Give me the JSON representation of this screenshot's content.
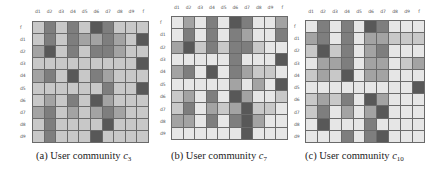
{
  "shade_scale": [
    "#e6e6e6",
    "#c8c8c8",
    "#a3a3a3",
    "#7e7e7e",
    "#585858"
  ],
  "chart_data": [
    {
      "type": "heatmap",
      "title": "(a) User community c3",
      "caption_prefix": "(a)  User community ",
      "caption_var": "c",
      "caption_sub": "3",
      "x_labels": [
        "d1",
        "d2",
        "d3",
        "d4",
        "d5",
        "d6",
        "d7",
        "d8",
        "d9",
        "f"
      ],
      "y_labels": [
        "f",
        "d1",
        "d2",
        "d3",
        "d4",
        "d5",
        "d6",
        "d7",
        "d8",
        "d9"
      ],
      "values": [
        [
          1,
          3,
          1,
          3,
          1,
          4,
          3,
          1,
          1,
          1
        ],
        [
          1,
          3,
          1,
          3,
          2,
          2,
          3,
          2,
          1,
          4
        ],
        [
          2,
          4,
          1,
          3,
          1,
          3,
          3,
          2,
          1,
          1
        ],
        [
          1,
          1,
          1,
          1,
          1,
          1,
          1,
          1,
          1,
          4
        ],
        [
          2,
          3,
          1,
          4,
          1,
          3,
          2,
          1,
          1,
          1
        ],
        [
          1,
          1,
          1,
          1,
          1,
          1,
          3,
          1,
          1,
          4
        ],
        [
          1,
          2,
          1,
          3,
          1,
          4,
          2,
          1,
          1,
          1
        ],
        [
          2,
          3,
          1,
          2,
          1,
          2,
          3,
          2,
          1,
          1
        ],
        [
          1,
          3,
          1,
          1,
          1,
          1,
          4,
          1,
          1,
          1
        ],
        [
          1,
          3,
          1,
          1,
          1,
          4,
          1,
          1,
          1,
          1
        ]
      ],
      "value_range": [
        0,
        4
      ]
    },
    {
      "type": "heatmap",
      "title": "(b) User community c7",
      "caption_prefix": "(b)  User community ",
      "caption_var": "c",
      "caption_sub": "7",
      "x_labels": [
        "d1",
        "d2",
        "d3",
        "d4",
        "d5",
        "d6",
        "d7",
        "d8",
        "d9",
        "f"
      ],
      "y_labels": [
        "f",
        "d1",
        "d2",
        "d3",
        "d4",
        "d5",
        "d6",
        "d7",
        "d8",
        "d9"
      ],
      "values": [
        [
          0,
          2,
          0,
          3,
          0,
          4,
          3,
          0,
          0,
          2
        ],
        [
          0,
          3,
          0,
          3,
          0,
          3,
          2,
          0,
          0,
          3
        ],
        [
          2,
          4,
          1,
          3,
          1,
          3,
          3,
          1,
          0,
          0
        ],
        [
          0,
          0,
          0,
          0,
          0,
          3,
          0,
          0,
          0,
          4
        ],
        [
          2,
          3,
          0,
          4,
          0,
          3,
          2,
          1,
          1,
          0
        ],
        [
          0,
          0,
          0,
          0,
          0,
          2,
          0,
          2,
          0,
          4
        ],
        [
          1,
          2,
          0,
          3,
          0,
          4,
          2,
          0,
          0,
          1
        ],
        [
          1,
          3,
          0,
          2,
          1,
          2,
          4,
          1,
          1,
          0
        ],
        [
          2,
          2,
          0,
          3,
          0,
          3,
          4,
          2,
          0,
          0
        ],
        [
          0,
          0,
          0,
          0,
          0,
          0,
          4,
          0,
          0,
          0
        ]
      ],
      "value_range": [
        0,
        4
      ]
    },
    {
      "type": "heatmap",
      "title": "(c) User community c10",
      "caption_prefix": "(c)  User community ",
      "caption_var": "c",
      "caption_sub": "10",
      "x_labels": [
        "d1",
        "d2",
        "d3",
        "d4",
        "d5",
        "d6",
        "d7",
        "d8",
        "d9",
        "f"
      ],
      "y_labels": [
        "f",
        "d1",
        "d2",
        "d3",
        "d4",
        "d5",
        "d6",
        "d7",
        "d8",
        "d9"
      ],
      "values": [
        [
          0,
          3,
          0,
          3,
          0,
          4,
          3,
          0,
          0,
          0
        ],
        [
          2,
          3,
          0,
          3,
          0,
          2,
          2,
          1,
          1,
          1
        ],
        [
          1,
          4,
          1,
          3,
          0,
          2,
          3,
          0,
          0,
          0
        ],
        [
          0,
          2,
          2,
          3,
          0,
          2,
          2,
          0,
          1,
          2
        ],
        [
          1,
          2,
          1,
          4,
          0,
          2,
          2,
          0,
          0,
          0
        ],
        [
          0,
          0,
          0,
          0,
          0,
          0,
          0,
          0,
          0,
          4
        ],
        [
          1,
          2,
          1,
          3,
          0,
          4,
          2,
          0,
          0,
          0
        ],
        [
          1,
          3,
          0,
          2,
          0,
          2,
          4,
          0,
          0,
          0
        ],
        [
          0,
          4,
          0,
          0,
          0,
          3,
          0,
          0,
          0,
          0
        ],
        [
          0,
          0,
          0,
          3,
          0,
          3,
          4,
          0,
          0,
          0
        ]
      ],
      "value_range": [
        0,
        4
      ]
    }
  ]
}
